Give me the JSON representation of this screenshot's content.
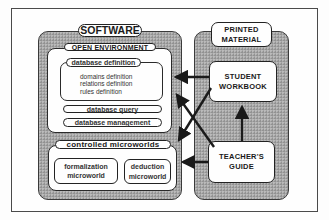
{
  "diagram": {
    "software": {
      "title": "SOFTWARE",
      "open_environment": {
        "title": "OPEN ENVIRONMENT",
        "database_definition": {
          "title": "database definition",
          "items": [
            "domains definition",
            "relations definition",
            "rules definition"
          ]
        },
        "database_query": "database query",
        "database_management": "database management"
      },
      "controlled_microworlds": {
        "title": "controlled microworlds",
        "microworlds": [
          {
            "line1": "formalization",
            "line2": "microworld"
          },
          {
            "line1": "deduction",
            "line2": "microworld"
          }
        ]
      }
    },
    "printed_material": {
      "title_line1": "PRINTED",
      "title_line2": "MATERIAL",
      "student_workbook": {
        "line1": "STUDENT",
        "line2": "WORKBOOK"
      },
      "teachers_guide": {
        "line1": "TEACHER'S",
        "line2": "GUIDE"
      }
    },
    "arrows": [
      {
        "from": "STUDENT WORKBOOK",
        "to": "database definition"
      },
      {
        "from": "STUDENT WORKBOOK",
        "to": "controlled microworlds"
      },
      {
        "from": "TEACHER'S GUIDE",
        "to": "OPEN ENVIRONMENT"
      },
      {
        "from": "TEACHER'S GUIDE",
        "to": "controlled microworlds"
      },
      {
        "from": "TEACHER'S GUIDE",
        "to": "STUDENT WORKBOOK"
      }
    ],
    "colors": {
      "panel_gray": "#a6a6a6",
      "line": "#1a1a1a",
      "background": "#fefefe"
    }
  }
}
